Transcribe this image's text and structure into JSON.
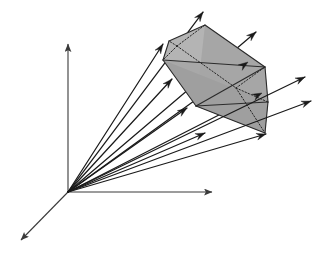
{
  "figure": {
    "title": "",
    "caption": "",
    "background_color": "#ffffff",
    "line_color": "#1a1a1a",
    "polyhedron_fill": "#a8a8a8",
    "polyhedron_stroke": "#2b2b2b",
    "hidden_edge_style": "dotted",
    "axis_color": "#3a3a3a"
  },
  "axes": {
    "origin": {
      "x": 68,
      "y": 192
    },
    "items": [
      {
        "name": "vertical-axis",
        "x2": 68,
        "y2": 44,
        "label": ""
      },
      {
        "name": "horizontal-axis",
        "x2": 212,
        "y2": 192,
        "label": ""
      },
      {
        "name": "depth-axis",
        "x2": 21,
        "y2": 240,
        "label": ""
      }
    ]
  },
  "chart_data": {
    "type": "scatter",
    "title": "",
    "xlabel": "",
    "ylabel": "",
    "ray_count": 11,
    "rays": [
      {
        "id": 1,
        "tip_x": 203,
        "tip_y": 12
      },
      {
        "id": 2,
        "tip_x": 256,
        "tip_y": 32
      },
      {
        "id": 3,
        "tip_x": 163,
        "tip_y": 44
      },
      {
        "id": 4,
        "tip_x": 248,
        "tip_y": 62
      },
      {
        "id": 5,
        "tip_x": 305,
        "tip_y": 77
      },
      {
        "id": 6,
        "tip_x": 172,
        "tip_y": 79
      },
      {
        "id": 7,
        "tip_x": 262,
        "tip_y": 93
      },
      {
        "id": 8,
        "tip_x": 311,
        "tip_y": 101
      },
      {
        "id": 9,
        "tip_x": 187,
        "tip_y": 108
      },
      {
        "id": 10,
        "tip_x": 205,
        "tip_y": 133
      },
      {
        "id": 11,
        "tip_x": 266,
        "tip_y": 134
      }
    ],
    "polyhedron": {
      "visible_vertices": [
        {
          "x": 205,
          "y": 25
        },
        {
          "x": 265,
          "y": 67
        },
        {
          "x": 268,
          "y": 102
        },
        {
          "x": 265,
          "y": 133
        },
        {
          "x": 196,
          "y": 106
        },
        {
          "x": 163,
          "y": 60
        },
        {
          "x": 169,
          "y": 41
        }
      ],
      "hidden_vertices": [
        {
          "x": 177,
          "y": 46
        },
        {
          "x": 236,
          "y": 88
        }
      ]
    }
  }
}
